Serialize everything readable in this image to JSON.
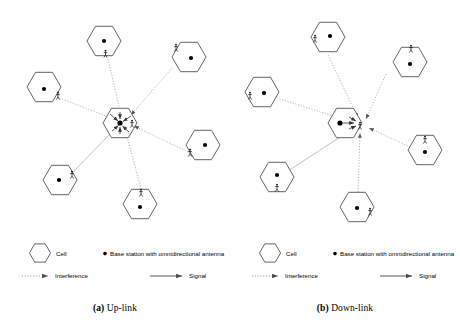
{
  "figure": {
    "panels": [
      {
        "id": "up-link",
        "caption_label": "(a)",
        "caption_text": "Up-link",
        "center_cell": {
          "name": "serving-cell",
          "base_station_label": "base-station-dot",
          "user_label": "mobile-user",
          "direction": "inbound"
        },
        "neighbor_count": 6,
        "legend": {
          "cell": "Cell",
          "base_station": "Base station with omnidirectional antenna",
          "interference": "Interference",
          "signal": "Signal"
        }
      },
      {
        "id": "down-link",
        "caption_label": "(b)",
        "caption_text": "Down-link",
        "center_cell": {
          "name": "serving-cell",
          "base_station_label": "base-station-dot",
          "user_label": "mobile-user",
          "direction": "outbound"
        },
        "neighbor_count": 6,
        "legend": {
          "cell": "Cell",
          "base_station": "Base station with omnidirectional antenna",
          "interference": "Interference",
          "signal": "Signal"
        }
      }
    ],
    "colors": {
      "cell_outline": "#3c3c3c",
      "base_station": "#000000",
      "interference_line": "#9a9a9a",
      "signal_line": "#9a9a9a",
      "text": "#000000",
      "background": "#ffffff"
    }
  }
}
